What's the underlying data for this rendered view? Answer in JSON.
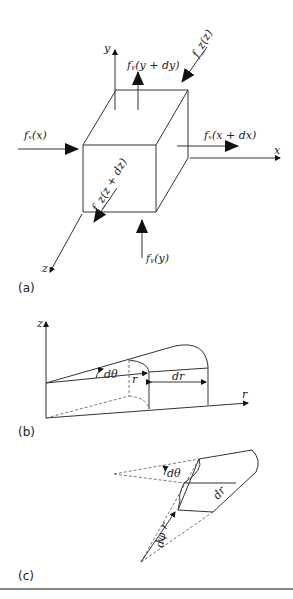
{
  "panels": {
    "a": {
      "caption": "(a)",
      "axes": {
        "x": "x",
        "y": "y",
        "z": "z"
      },
      "forces": {
        "fx_left": "fₓ(x)",
        "fx_right": "fₓ(x + dx)",
        "fy_top": "fᵧ(y + dy)",
        "fy_bottom": "fᵧ(y)",
        "fz_top": "f_z(z)",
        "fz_bottom": "f_z(z + dz)"
      }
    },
    "b": {
      "caption": "(b)",
      "axes": {
        "z": "z",
        "r": "r"
      },
      "labels": {
        "dtheta": "dθ",
        "r": "r",
        "dr": "dr"
      }
    },
    "c": {
      "caption": "(c)",
      "labels": {
        "dtheta": "dθ",
        "r": "r",
        "dr": "dr",
        "dphi": "dφ"
      }
    }
  }
}
